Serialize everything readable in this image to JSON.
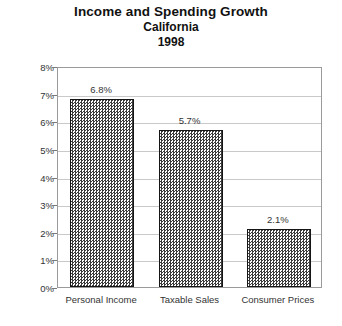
{
  "chart_data": {
    "type": "bar",
    "title": "Income and Spending Growth",
    "subtitle_region": "California",
    "subtitle_year": "1998",
    "xlabel": "",
    "ylabel": "(% change vs 1997)",
    "categories": [
      "Personal Income",
      "Taxable Sales",
      "Consumer Prices"
    ],
    "values": [
      6.8,
      5.7,
      2.1
    ],
    "value_labels": [
      "6.8%",
      "5.7%",
      "2.1%"
    ],
    "ylim": [
      0,
      8
    ],
    "ytick_labels": [
      "8%",
      "7%",
      "6%",
      "5%",
      "4%",
      "3%",
      "2%",
      "1%",
      "0%"
    ],
    "ytick_values": [
      8,
      7,
      6,
      5,
      4,
      3,
      2,
      1,
      0
    ],
    "grid": true,
    "legend": false,
    "bar_fill": "#3b3b3b",
    "bar_border": "#151515",
    "grid_color": "#c9c9c9",
    "axis_color": "#9a9a9a",
    "background": "#ffffff"
  },
  "axis": {
    "y_title": "(% change vs 1997)"
  }
}
